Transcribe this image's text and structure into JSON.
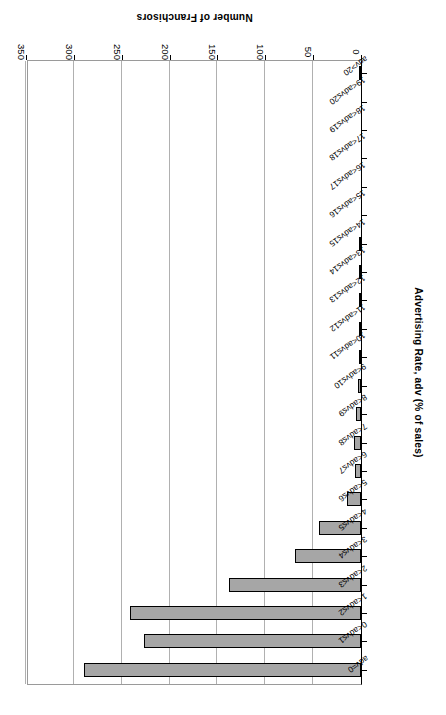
{
  "chart_data": {
    "type": "bar",
    "orientation": "horizontal",
    "title": "",
    "xlabel": "Number of Franchisors",
    "ylabel": "Advertising Rate, adv (% of sales)",
    "xlim": [
      0,
      350
    ],
    "xticks": [
      0,
      50,
      100,
      150,
      200,
      250,
      300,
      350
    ],
    "grid": true,
    "legend": "none",
    "rotation_deg": 180,
    "categories": [
      "adv=0",
      "0<adv≤1",
      "1<adv≤2",
      "2<adv≤3",
      "3<adv≤4",
      "4<adv≤5",
      "5<adv≤6",
      "6<adv≤7",
      "7<adv≤8",
      "8<adv≤9",
      "9<adv≤10",
      "10<adv≤11",
      "11<adv≤12",
      "12<adv≤13",
      "13<adv≤14",
      "14<adv≤15",
      "15<adv≤16",
      "16<adv≤17",
      "17<adv≤18",
      "18<adv≤19",
      "19<adv≤20",
      "adv>20"
    ],
    "values": [
      289,
      227,
      241,
      138,
      69,
      44,
      15,
      6,
      7,
      5,
      3,
      1,
      1,
      1,
      2,
      1,
      0,
      0,
      0,
      0,
      0,
      1
    ],
    "bar_fill_color": "#a6a6a6",
    "bar_edge_color": "#000000",
    "gridline_color": "#b0b0b0",
    "axis_color": "#000000"
  },
  "axes": {
    "value_axis_title": "Number of Franchisors",
    "category_axis_title": "Advertising Rate, adv (% of sales)"
  }
}
